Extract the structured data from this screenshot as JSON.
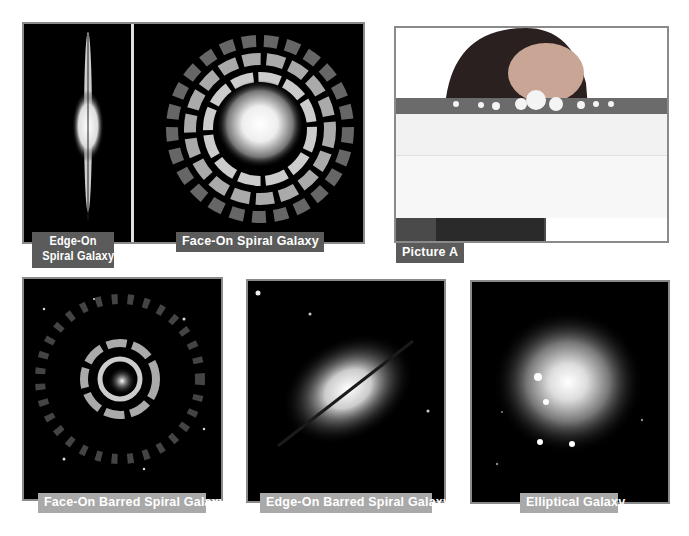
{
  "figures": [
    {
      "id": "edge-on-spiral",
      "label_line1": "Edge-On",
      "label_line2": "Spiral Galaxy"
    },
    {
      "id": "face-on-spiral",
      "label": "Face-On Spiral Galaxy"
    },
    {
      "id": "picture-a",
      "label": "Picture A"
    },
    {
      "id": "face-on-barred-spiral",
      "label": "Face-On Barred Spiral Galaxy"
    },
    {
      "id": "edge-on-barred-spiral",
      "label": "Edge-On Barred Spiral Galaxy"
    },
    {
      "id": "elliptical",
      "label": "Elliptical Galaxy"
    }
  ],
  "colors": {
    "frame": "#8a8a8a",
    "label_dark": "#5b5b5b",
    "label_light": "#a9a9a9",
    "space": "#000000"
  }
}
